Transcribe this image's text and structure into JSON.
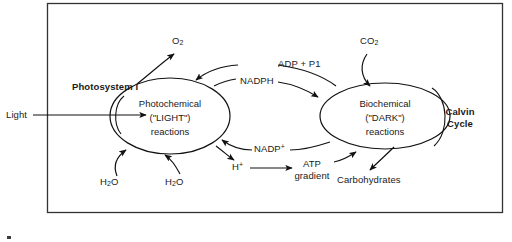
{
  "diagram": {
    "title_text": "Photosynthesis overview diagram",
    "frame": {
      "stroke": "#333333",
      "fill": "#ffffff"
    },
    "line_color": "#111111",
    "background": "#ffffff",
    "external_inputs": {
      "light_label": "Light"
    },
    "photosystem": {
      "label": "Photosystem I"
    },
    "left_cycle": {
      "name": "light-reactions",
      "line1": "Photochemical",
      "line2": "(\"LIGHT\")",
      "line3": "reactions"
    },
    "right_cycle": {
      "name": "dark-reactions",
      "line1": "Biochemical",
      "line2": "(\"DARK\")",
      "line3": "reactions",
      "side_label_line1": "Calvin",
      "side_label_line2": "Cycle"
    },
    "molecules": {
      "oxygen": {
        "text": "O",
        "sub": "2"
      },
      "carbon_dioxide": {
        "text": "CO",
        "sub": "2"
      },
      "water_left": {
        "text": "H",
        "sub": "2",
        "text2": "O"
      },
      "water_right": {
        "text": "H",
        "sub": "2",
        "text2": "O"
      },
      "adp_pi": "ADP + P1",
      "nadph": "NADPH",
      "nadp_plus": {
        "text": "NADP",
        "sup": "+"
      },
      "proton": {
        "text": "H",
        "sup": "+"
      },
      "atp_gradient_line1": "ATP",
      "atp_gradient_line2": "gradient",
      "carbohydrates": "Carbohydrates"
    }
  }
}
